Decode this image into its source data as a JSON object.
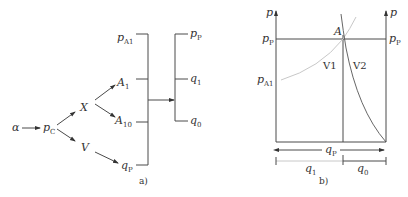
{
  "figure_a": {
    "caption": "a)",
    "input": {
      "main": "α"
    },
    "node_pc": {
      "main": "p",
      "sub": "C"
    },
    "node_x": {
      "main": "X"
    },
    "node_v": {
      "main": "V"
    },
    "node_a1": {
      "main": "A",
      "sub": "1"
    },
    "node_a10": {
      "main": "A",
      "sub": "10"
    },
    "node_qp": {
      "main": "q",
      "sub": "P"
    },
    "node_pa1": {
      "main": "p",
      "sub": "A1"
    },
    "out_pp": {
      "main": "p",
      "sub": "P"
    },
    "out_q1": {
      "main": "q",
      "sub": "1"
    },
    "out_q0": {
      "main": "q",
      "sub": "0"
    }
  },
  "figure_b": {
    "caption": "b)",
    "left_axis": {
      "main": "p"
    },
    "right_axis": {
      "main": "p"
    },
    "pp_left": {
      "main": "p",
      "sub": "P"
    },
    "pp_right": {
      "main": "p",
      "sub": "P"
    },
    "pa1": {
      "main": "p",
      "sub": "A1"
    },
    "point_a": {
      "main": "A"
    },
    "region_v1": "V1",
    "region_v2": "V2",
    "dim_qp": {
      "main": "q",
      "sub": "P"
    },
    "dim_q1": {
      "main": "q",
      "sub": "1"
    },
    "dim_q0": {
      "main": "q",
      "sub": "0"
    }
  },
  "colors": {
    "line": "#4a4a4a",
    "light_curve": "#c8c8c8",
    "text": "#333333"
  }
}
